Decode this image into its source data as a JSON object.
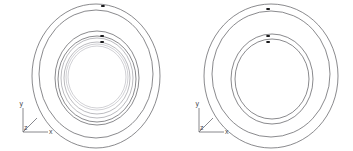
{
  "viewport": {
    "title": "Concentric Ring Assemblies — Isometric Face View",
    "background_color": "#ffffff",
    "width": 353,
    "height": 151
  },
  "style": {
    "line_color": "#58585c",
    "line_color_faint": "#8d8d93",
    "line_color_pale": "#b2b2b8",
    "vertex_color": "#1b1b1d",
    "axis_color": "#6a6a70",
    "axis_label_color": "#4a4a50"
  },
  "figures": [
    {
      "id": "left-assembly",
      "name": "Left Ring Assembly",
      "center": {
        "x": 96,
        "y": 76
      },
      "circles": [
        {
          "name": "outer-rim",
          "rx": 64,
          "ry": 72,
          "cx": 96,
          "cy": 76,
          "tone": "solid"
        },
        {
          "name": "outer-rim-inner-edge",
          "rx": 57,
          "ry": 64,
          "cx": 96,
          "cy": 74,
          "tone": "solid"
        },
        {
          "name": "mid-ring-outer",
          "rx": 42,
          "ry": 47,
          "cx": 97,
          "cy": 78,
          "tone": "solid"
        },
        {
          "name": "mid-ring-inner",
          "rx": 39,
          "ry": 43,
          "cx": 97,
          "cy": 79,
          "tone": "solid"
        },
        {
          "name": "cage-ring-outer",
          "rx": 36,
          "ry": 40,
          "cx": 97,
          "cy": 78,
          "tone": "faint"
        },
        {
          "name": "cage-ring-inner",
          "rx": 33,
          "ry": 36,
          "cx": 97,
          "cy": 78,
          "tone": "faint"
        },
        {
          "name": "bore-ring-outer",
          "rx": 31,
          "ry": 33,
          "cx": 97,
          "cy": 77,
          "tone": "pale"
        },
        {
          "name": "bore-ring-inner",
          "rx": 29,
          "ry": 31,
          "cx": 97,
          "cy": 77,
          "tone": "pale"
        }
      ],
      "vertices": [
        {
          "name": "vertex-outer-top",
          "x": 103,
          "y": 6
        },
        {
          "name": "vertex-mid-top",
          "x": 102,
          "y": 36
        },
        {
          "name": "vertex-cage-top",
          "x": 102,
          "y": 42
        }
      ],
      "axis_triad": {
        "origin": {
          "x": 23,
          "y": 132
        },
        "labels": {
          "x": "x",
          "y": "y",
          "z": "z"
        },
        "x_end": {
          "x": 48,
          "y": 132
        },
        "y_end": {
          "x": 23,
          "y": 108
        },
        "z_end": {
          "x": 36,
          "y": 119
        }
      }
    },
    {
      "id": "right-assembly",
      "name": "Right Ring Assembly",
      "center": {
        "x": 271,
        "y": 76
      },
      "circles": [
        {
          "name": "outer-rim",
          "rx": 67,
          "ry": 72,
          "cx": 271,
          "cy": 76,
          "tone": "solid"
        },
        {
          "name": "outer-rim-inner-edge",
          "rx": 59,
          "ry": 63,
          "cx": 271,
          "cy": 74,
          "tone": "solid"
        },
        {
          "name": "bore-ring-outer",
          "rx": 41,
          "ry": 45,
          "cx": 272,
          "cy": 79,
          "tone": "solid"
        },
        {
          "name": "bore-ring-inner",
          "rx": 37,
          "ry": 40,
          "cx": 272,
          "cy": 79,
          "tone": "solid"
        }
      ],
      "vertices": [
        {
          "name": "vertex-outer-top",
          "x": 268,
          "y": 9
        },
        {
          "name": "vertex-bore-top",
          "x": 268,
          "y": 36
        },
        {
          "name": "vertex-inner-top",
          "x": 268,
          "y": 42
        }
      ],
      "axis_triad": {
        "origin": {
          "x": 199,
          "y": 132
        },
        "labels": {
          "x": "x",
          "y": "y",
          "z": "z"
        },
        "x_end": {
          "x": 224,
          "y": 132
        },
        "y_end": {
          "x": 199,
          "y": 108
        },
        "z_end": {
          "x": 212,
          "y": 119
        }
      }
    }
  ]
}
